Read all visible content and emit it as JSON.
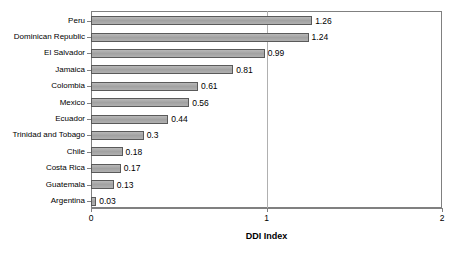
{
  "chart_data": {
    "type": "bar",
    "orientation": "horizontal",
    "title": "",
    "xlabel": "DDI Index",
    "ylabel": "",
    "xlim": [
      0,
      2
    ],
    "xticks": [
      "0",
      "1",
      "2"
    ],
    "grid": "vertical gridline at x=1",
    "legend": "none",
    "categories": [
      "Peru",
      "Dominican Republic",
      "El Salvador",
      "Jamaica",
      "Colombia",
      "Mexico",
      "Ecuador",
      "Trinidad and Tobago",
      "Chile",
      "Costa Rica",
      "Guatemala",
      "Argentina"
    ],
    "values": [
      1.26,
      1.24,
      0.99,
      0.81,
      0.61,
      0.56,
      0.44,
      0.3,
      0.18,
      0.17,
      0.13,
      0.03
    ],
    "value_labels": [
      "1.26",
      "1.24",
      "0.99",
      "0.81",
      "0.61",
      "0.56",
      "0.44",
      "0.3",
      "0.18",
      "0.17",
      "0.13",
      "0.03"
    ],
    "bar_color": "#a6a6a6",
    "bar_border_color": "#5a5a5a",
    "axis_color": "#808080",
    "gridline_color": "#b0b0b0",
    "plot_background": "#ffffff"
  }
}
